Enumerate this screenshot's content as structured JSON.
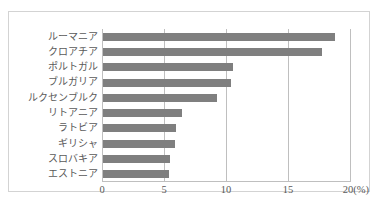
{
  "top_caption": "",
  "chart_data": {
    "type": "bar",
    "orientation": "horizontal",
    "title": "",
    "subtitle": "",
    "xlabel": "(%)",
    "ylabel": "",
    "unit_label": "(%)",
    "categories": [
      "ルーマニア",
      "クロアチア",
      "ポルトガル",
      "ブルガリア",
      "ルクセンブルク",
      "リトアニア",
      "ラトビア",
      "ギリシャ",
      "スロバキア",
      "エストニア"
    ],
    "values": [
      18.7,
      17.7,
      10.5,
      10.3,
      9.2,
      6.4,
      5.9,
      5.8,
      5.4,
      5.3
    ],
    "xlim": [
      0,
      20
    ],
    "xticks": [
      0,
      5,
      10,
      15,
      20
    ],
    "xtick_labels": [
      "0",
      "5",
      "10",
      "15",
      "20(%)"
    ],
    "grid": true,
    "grid_axis": "x",
    "legend": false,
    "series": [
      {
        "name": "",
        "color": "#7f7f7f",
        "values": [
          18.7,
          17.7,
          10.5,
          10.3,
          9.2,
          6.4,
          5.9,
          5.8,
          5.4,
          5.3
        ]
      }
    ]
  },
  "colors": {
    "bar": "#7f7f7f",
    "grid": "#bfbfbf",
    "frame": "#d3d3d3",
    "text": "#595959",
    "background": "#ffffff"
  }
}
